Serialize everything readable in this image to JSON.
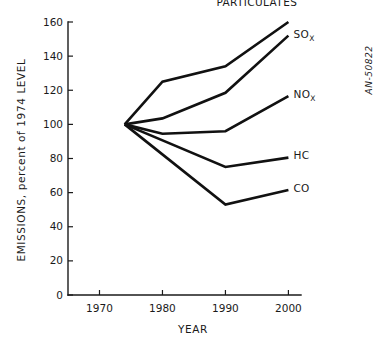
{
  "figure": {
    "corner_id": "AN-50822",
    "background_color": "#ffffff",
    "ink_color": "#111111"
  },
  "chart_data": {
    "type": "line",
    "title": "",
    "subtitle": "",
    "xlabel": "YEAR",
    "ylabel": "EMISSIONS, percent of 1974 LEVEL",
    "xlim": [
      1965,
      2002
    ],
    "ylim": [
      0,
      160
    ],
    "xticks": [
      1970,
      1980,
      1990,
      2000
    ],
    "xtick_labels": [
      "1970",
      "1980",
      "1990",
      "2000"
    ],
    "yticks": [
      0,
      20,
      40,
      60,
      80,
      100,
      120,
      140,
      160
    ],
    "ytick_labels": [
      "0",
      "20",
      "40",
      "60",
      "80",
      "100",
      "120",
      "140",
      "160"
    ],
    "grid": false,
    "legend_position": "right-inline-labels",
    "baseline_year": 1974,
    "baseline_value": 100,
    "series": [
      {
        "name": "PARTICULATES",
        "label_main": "PARTICULATES",
        "label_sub": "",
        "x": [
          1974,
          1980,
          1990,
          2000
        ],
        "values": [
          100,
          125,
          134,
          160
        ]
      },
      {
        "name": "SOx",
        "label_main": "SO",
        "label_sub": "X",
        "x": [
          1974,
          1980,
          1990,
          2000
        ],
        "values": [
          100,
          103.5,
          118.5,
          152
        ]
      },
      {
        "name": "NOx",
        "label_main": "NO",
        "label_sub": "X",
        "x": [
          1974,
          1980,
          1990,
          2000
        ],
        "values": [
          100,
          94.5,
          96,
          116.5
        ]
      },
      {
        "name": "HC",
        "label_main": "HC",
        "label_sub": "",
        "x": [
          1974,
          1990,
          2000
        ],
        "values": [
          100,
          75,
          80.5
        ]
      },
      {
        "name": "CO",
        "label_main": "CO",
        "label_sub": "",
        "x": [
          1974,
          1990,
          2000
        ],
        "values": [
          100,
          53,
          61.5
        ]
      }
    ]
  }
}
